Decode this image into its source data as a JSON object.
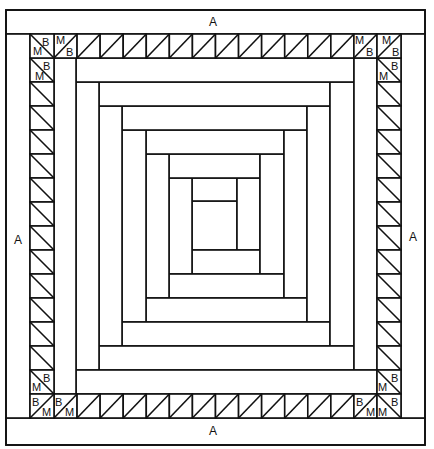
{
  "diagram": {
    "colors": {
      "line": "#111111",
      "fill": "#ffffff"
    },
    "outer_frame": {
      "x": 6,
      "y": 10,
      "w": 419,
      "h": 435
    },
    "a_strips": [
      {
        "id": "top",
        "x": 6,
        "y": 10,
        "w": 419,
        "h": 24,
        "label": "A",
        "label_x": 213,
        "label_y": 26
      },
      {
        "id": "bottom",
        "x": 6,
        "y": 418,
        "w": 419,
        "h": 27,
        "label": "A",
        "label_x": 213,
        "label_y": 435
      },
      {
        "id": "left",
        "x": 6,
        "y": 34,
        "w": 24,
        "h": 384,
        "label": "A",
        "label_x": 18,
        "label_y": 244
      },
      {
        "id": "right",
        "x": 401,
        "y": 34,
        "w": 24,
        "h": 384,
        "label": "A",
        "label_x": 413,
        "label_y": 241
      }
    ],
    "triangle_border": {
      "top_row": {
        "y": 34,
        "h": 24,
        "x_start": 54,
        "x_end": 377,
        "count": 14,
        "diagonal": "bl-tr"
      },
      "bottom_row": {
        "y": 394,
        "h": 24,
        "x_start": 54,
        "x_end": 377,
        "count": 14,
        "diagonal": "bl-tr"
      },
      "left_col": {
        "x": 30,
        "w": 24,
        "y_start": 58,
        "y_end": 394,
        "count": 14,
        "diagonal": "tl-br"
      },
      "right_col": {
        "x": 377,
        "w": 24,
        "y_start": 58,
        "y_end": 394,
        "count": 14,
        "diagonal": "tl-br"
      },
      "corners": [
        {
          "id": "top-left",
          "x": 30,
          "y": 34,
          "diagonal": "tl-br"
        },
        {
          "id": "top-right",
          "x": 377,
          "y": 34,
          "diagonal": "bl-tr"
        },
        {
          "id": "bottom-left",
          "x": 30,
          "y": 394,
          "diagonal": "bl-tr"
        },
        {
          "id": "bottom-right",
          "x": 377,
          "y": 394,
          "diagonal": "tl-br"
        }
      ],
      "labels": [
        {
          "text": "B",
          "x": 42,
          "y": 46
        },
        {
          "text": "M",
          "x": 33,
          "y": 55
        },
        {
          "text": "M",
          "x": 56,
          "y": 44
        },
        {
          "text": "B",
          "x": 66,
          "y": 56
        },
        {
          "text": "B",
          "x": 43,
          "y": 70
        },
        {
          "text": "M",
          "x": 35,
          "y": 80
        },
        {
          "text": "M",
          "x": 355,
          "y": 44
        },
        {
          "text": "B",
          "x": 366,
          "y": 56
        },
        {
          "text": "M",
          "x": 382,
          "y": 44
        },
        {
          "text": "B",
          "x": 392,
          "y": 56
        },
        {
          "text": "B",
          "x": 391,
          "y": 70
        },
        {
          "text": "M",
          "x": 379,
          "y": 80
        },
        {
          "text": "B",
          "x": 43,
          "y": 382
        },
        {
          "text": "M",
          "x": 32,
          "y": 391
        },
        {
          "text": "B",
          "x": 32,
          "y": 406
        },
        {
          "text": "M",
          "x": 42,
          "y": 416
        },
        {
          "text": "B",
          "x": 55,
          "y": 406
        },
        {
          "text": "M",
          "x": 65,
          "y": 416
        },
        {
          "text": "B",
          "x": 391,
          "y": 382
        },
        {
          "text": "M",
          "x": 378,
          "y": 391
        },
        {
          "text": "B",
          "x": 356,
          "y": 406
        },
        {
          "text": "M",
          "x": 366,
          "y": 416
        },
        {
          "text": "M",
          "x": 378,
          "y": 416
        },
        {
          "text": "B",
          "x": 391,
          "y": 406
        }
      ]
    },
    "log_cabin": {
      "bounds": {
        "x": 54,
        "y": 58,
        "w": 323,
        "h": 336
      },
      "pieces": [
        {
          "name": "center",
          "x": 192,
          "y": 201,
          "w": 45,
          "h": 49
        },
        {
          "name": "log-1-top",
          "x": 192,
          "y": 178,
          "w": 45,
          "h": 23
        },
        {
          "name": "log-2-right",
          "x": 237,
          "y": 178,
          "w": 23,
          "h": 72
        },
        {
          "name": "log-3-bottom",
          "x": 192,
          "y": 250,
          "w": 68,
          "h": 24
        },
        {
          "name": "log-4-left",
          "x": 169,
          "y": 178,
          "w": 23,
          "h": 96
        },
        {
          "name": "log-5-top",
          "x": 169,
          "y": 154,
          "w": 91,
          "h": 24
        },
        {
          "name": "log-6-right",
          "x": 260,
          "y": 154,
          "w": 24,
          "h": 120
        },
        {
          "name": "log-7-bottom",
          "x": 169,
          "y": 274,
          "w": 115,
          "h": 24
        },
        {
          "name": "log-8-left",
          "x": 146,
          "y": 154,
          "w": 23,
          "h": 144
        },
        {
          "name": "log-9-top",
          "x": 146,
          "y": 130,
          "w": 138,
          "h": 24
        },
        {
          "name": "log-10-right",
          "x": 284,
          "y": 130,
          "w": 23,
          "h": 168
        },
        {
          "name": "log-11-bottom",
          "x": 146,
          "y": 298,
          "w": 161,
          "h": 24
        },
        {
          "name": "log-12-left",
          "x": 122,
          "y": 130,
          "w": 24,
          "h": 192
        },
        {
          "name": "log-13-top",
          "x": 122,
          "y": 106,
          "w": 185,
          "h": 24
        },
        {
          "name": "log-14-right",
          "x": 307,
          "y": 106,
          "w": 23,
          "h": 216
        },
        {
          "name": "log-15-bottom",
          "x": 122,
          "y": 322,
          "w": 208,
          "h": 24
        },
        {
          "name": "log-16-left",
          "x": 99,
          "y": 106,
          "w": 23,
          "h": 240
        },
        {
          "name": "log-17-top",
          "x": 99,
          "y": 82,
          "w": 231,
          "h": 24
        },
        {
          "name": "log-18-right",
          "x": 330,
          "y": 82,
          "w": 24,
          "h": 264
        },
        {
          "name": "log-19-bottom",
          "x": 99,
          "y": 346,
          "w": 255,
          "h": 24
        },
        {
          "name": "log-20-left",
          "x": 76,
          "y": 82,
          "w": 23,
          "h": 288
        },
        {
          "name": "log-21-top",
          "x": 76,
          "y": 58,
          "w": 278,
          "h": 24
        },
        {
          "name": "log-22-right",
          "x": 354,
          "y": 58,
          "w": 23,
          "h": 312
        },
        {
          "name": "log-23-bottom",
          "x": 76,
          "y": 370,
          "w": 301,
          "h": 24
        },
        {
          "name": "log-24-left",
          "x": 54,
          "y": 58,
          "w": 22,
          "h": 336
        }
      ]
    }
  }
}
